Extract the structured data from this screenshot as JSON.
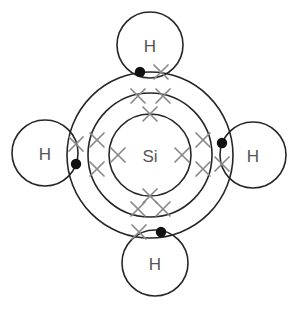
{
  "diagram": {
    "molecule_formula": "SiH4",
    "background_color": "#ffffff",
    "line_color": "#262626",
    "label_color": "#555555",
    "cross_color": "#8a8a8a",
    "dot_color": "#111111",
    "width": 299,
    "height": 309,
    "central_atom": {
      "symbol": "Si",
      "name": "silicon",
      "center": {
        "x": 150,
        "y": 155
      }
    },
    "shells": [
      {
        "name": "inner-shell",
        "radius": 41,
        "electron_count": 4
      },
      {
        "name": "middle-shell",
        "radius": 62,
        "electron_count": 8
      },
      {
        "name": "outer-shell",
        "radius": 83,
        "electron_count": 8
      }
    ],
    "hydrogen_atoms": [
      {
        "symbol": "H",
        "position": "top",
        "center": {
          "x": 150,
          "y": 45
        },
        "radius": 33
      },
      {
        "symbol": "H",
        "position": "left",
        "center": {
          "x": 45,
          "y": 153
        },
        "radius": 33
      },
      {
        "symbol": "H",
        "position": "right",
        "center": {
          "x": 253,
          "y": 155
        },
        "radius": 33
      },
      {
        "symbol": "H",
        "position": "bottom",
        "center": {
          "x": 155,
          "y": 263
        },
        "radius": 33
      }
    ],
    "inner_shell_crosses": [
      {
        "x": 150,
        "y": 114
      },
      {
        "x": 150,
        "y": 196
      },
      {
        "x": 118,
        "y": 155
      },
      {
        "x": 182,
        "y": 155
      }
    ],
    "middle_shell_crosses": [
      {
        "x": 138,
        "y": 96
      },
      {
        "x": 163,
        "y": 96
      },
      {
        "x": 97,
        "y": 140
      },
      {
        "x": 97,
        "y": 169
      },
      {
        "x": 203,
        "y": 140
      },
      {
        "x": 203,
        "y": 169
      },
      {
        "x": 138,
        "y": 209
      },
      {
        "x": 163,
        "y": 209
      }
    ],
    "bonding_pairs": [
      {
        "bond": "Si-H-top",
        "dot": {
          "x": 140,
          "y": 72
        },
        "cross": {
          "x": 161,
          "y": 72
        }
      },
      {
        "bond": "Si-H-left",
        "dot": {
          "x": 76,
          "y": 164
        },
        "cross": {
          "x": 76,
          "y": 144
        }
      },
      {
        "bond": "Si-H-right",
        "dot": {
          "x": 222,
          "y": 143
        },
        "cross": {
          "x": 222,
          "y": 164
        }
      },
      {
        "bond": "Si-H-bottom",
        "dot": {
          "x": 161,
          "y": 232
        },
        "cross": {
          "x": 139,
          "y": 232
        }
      }
    ],
    "dot_radius": 5.2,
    "cross_arm": 7
  }
}
